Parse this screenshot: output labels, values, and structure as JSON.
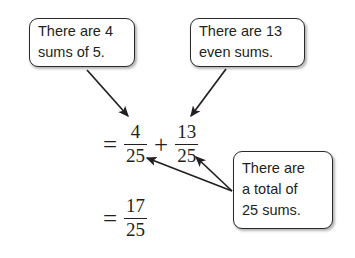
{
  "diagram": {
    "background_color": "#ffffff",
    "ink_color": "#231f20",
    "callouts": [
      {
        "name": "four-sums",
        "line1": "There are 4",
        "line2": "sums of 5."
      },
      {
        "name": "even-sums",
        "line1": "There are 13",
        "line2": "even sums."
      },
      {
        "name": "total-sums",
        "line1": "There are",
        "line2": "a total of",
        "line3": "25 sums."
      }
    ],
    "equations": [
      {
        "name": "sum-line",
        "equals": "=",
        "left_numerator": "4",
        "left_denominator": "25",
        "operator": "+",
        "right_numerator": "13",
        "right_denominator": "25"
      },
      {
        "name": "result-line",
        "equals": "=",
        "numerator": "17",
        "denominator": "25"
      }
    ],
    "arrows": [
      {
        "name": "arrow-four-sums-to-left-numerator",
        "from": "callout-four-sums",
        "to": "4/25"
      },
      {
        "name": "arrow-even-sums-to-right-numerator",
        "from": "callout-even-sums",
        "to": "13/25"
      },
      {
        "name": "arrow-total-sums-to-left-denominator",
        "from": "callout-total-sums",
        "to": "25 of 4/25"
      },
      {
        "name": "arrow-total-sums-to-right-denominator",
        "from": "callout-total-sums",
        "to": "25 of 13/25"
      }
    ]
  }
}
